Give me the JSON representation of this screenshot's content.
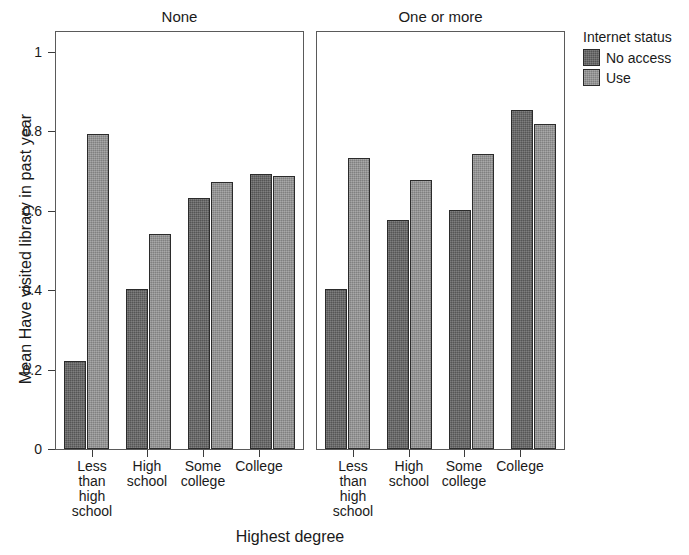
{
  "chart_data": {
    "type": "bar",
    "title": "",
    "xlabel": "Highest degree",
    "ylabel": "Mean Have visited library in past year",
    "ylim": [
      0,
      1.05
    ],
    "yticks": [
      "0",
      "0.2",
      "0.4",
      "0.6",
      "0.8",
      "1"
    ],
    "ytick_values": [
      0,
      0.2,
      0.4,
      0.6,
      0.8,
      1
    ],
    "grid": false,
    "legend": {
      "title": "Internet status",
      "position": "right",
      "entries": [
        {
          "name": "No access",
          "color": "#606060"
        },
        {
          "name": "Use",
          "color": "#8e8e8e"
        }
      ]
    },
    "facet_variable": "Number of children",
    "panels": [
      {
        "label": "None",
        "categories": [
          "Less than high school",
          "High school",
          "Some college",
          "College"
        ],
        "series": [
          {
            "name": "No access",
            "values": [
              0.22,
              0.4,
              0.63,
              0.69
            ]
          },
          {
            "name": "Use",
            "values": [
              0.79,
              0.54,
              0.67,
              0.685
            ]
          }
        ]
      },
      {
        "label": "One or more",
        "categories": [
          "Less than high school",
          "High school",
          "Some college",
          "College"
        ],
        "series": [
          {
            "name": "No access",
            "values": [
              0.4,
              0.575,
              0.6,
              0.85
            ]
          },
          {
            "name": "Use",
            "values": [
              0.73,
              0.675,
              0.74,
              0.815
            ]
          }
        ]
      }
    ]
  },
  "axis": {
    "y_title": "Mean Have visited library in past year",
    "x_title": "Highest degree",
    "y_ticks": [
      "1",
      "0.8",
      "0.6",
      "0.4",
      "0.2",
      "0"
    ],
    "x_tick_labels": [
      "Less\nthan\nhigh\nschool",
      "High\nschool",
      "Some\ncollege",
      "College"
    ]
  },
  "panel_titles": {
    "left": "None",
    "right": "One or more"
  },
  "legend": {
    "title": "Internet status",
    "item0": "No access",
    "item1": "Use"
  },
  "xlabels": {
    "l0a": "Less",
    "l0b": "than",
    "l0c": "high",
    "l0d": "school",
    "l1a": "High",
    "l1b": "school",
    "l2a": "Some",
    "l2b": "college",
    "l3a": "College"
  },
  "colors": {
    "no_access": "#606060",
    "use": "#8e8e8e",
    "panel_border": "#5a5a5a",
    "bar_outline": "#2b2b2b",
    "background": "#ffffff"
  }
}
